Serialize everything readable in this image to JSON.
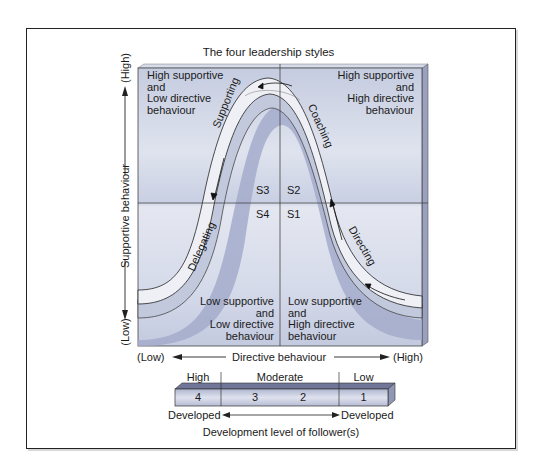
{
  "title": "The four leadership styles",
  "quadrants": {
    "top_left": [
      "High supportive",
      "and",
      "Low directive",
      "behaviour"
    ],
    "top_right": [
      "High supportive",
      "and",
      "High directive",
      "behaviour"
    ],
    "bottom_left": [
      "Low supportive",
      "and",
      "Low directive",
      "behaviour"
    ],
    "bottom_right": [
      "Low supportive",
      "and",
      "High directive",
      "behaviour"
    ]
  },
  "styles": {
    "s1": "S1",
    "s2": "S2",
    "s3": "S3",
    "s4": "S4"
  },
  "curve_labels": {
    "directing": "Directing",
    "coaching": "Coaching",
    "supporting": "Supporting",
    "delegating": "Delegating"
  },
  "y_axis": {
    "label": "Supportive behaviour",
    "high": "(High)",
    "low": "(Low)"
  },
  "x_axis": {
    "label": "Directive behaviour",
    "low": "(Low)",
    "high": "(High)"
  },
  "development_bar": {
    "headers": [
      "High",
      "Moderate",
      "Low"
    ],
    "numbers": [
      "4",
      "3",
      "2",
      "1"
    ],
    "left_end": "Developed",
    "right_end": "Developed",
    "caption": "Development level of follower(s)"
  },
  "colors": {
    "plot_bg": "#c9d0e2",
    "plot_light": "#e6e9f1",
    "curve_shadow": "#9ea6c6",
    "curve_fill": "#eef0f6",
    "bar_face": "#c8cde0",
    "bar_top": "#6f7698"
  }
}
